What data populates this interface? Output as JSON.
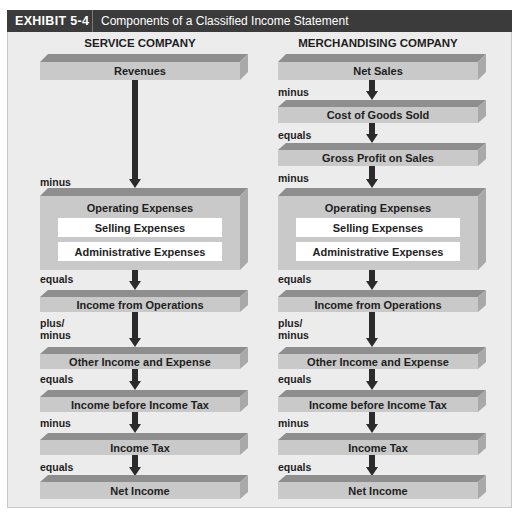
{
  "header": {
    "exhibit": "EXHIBIT 5-4",
    "title": "Components of a Classified Income Statement"
  },
  "service": {
    "title": "SERVICE COMPANY",
    "revenues": "Revenues",
    "minus1": "minus",
    "operating": "Operating  Expenses",
    "selling": "Selling Expenses",
    "admin": "Administrative Expenses",
    "equals1": "equals",
    "ops_income": "Income from Operations",
    "plusminus_a": "plus/",
    "plusminus_b": "minus",
    "other": "Other Income and Expense",
    "equals2": "equals",
    "before_tax": "Income before Income Tax",
    "minus2": "minus",
    "tax": "Income Tax",
    "equals3": "equals",
    "net": "Net Income"
  },
  "merch": {
    "title": "MERCHANDISING COMPANY",
    "net_sales": "Net Sales",
    "minus0": "minus",
    "cogs": "Cost of Goods Sold",
    "equals0": "equals",
    "gross": "Gross Profit on Sales",
    "minus1": "minus",
    "operating": "Operating  Expenses",
    "selling": "Selling Expenses",
    "admin": "Administrative Expenses",
    "equals1": "equals",
    "ops_income": "Income from Operations",
    "plusminus_a": "plus/",
    "plusminus_b": "minus",
    "other": "Other Income and Expense",
    "equals2": "equals",
    "before_tax": "Income before Income Tax",
    "minus2": "minus",
    "tax": "Income Tax",
    "equals3": "equals",
    "net": "Net Income"
  },
  "colors": {
    "header_bg": "#3b3b3b",
    "panel_bg": "#ececec",
    "box_front": "#c9c9c9",
    "box_top": "#8e8e8e",
    "box_side": "#a9a9a9",
    "arrow": "#2b2b2b"
  }
}
